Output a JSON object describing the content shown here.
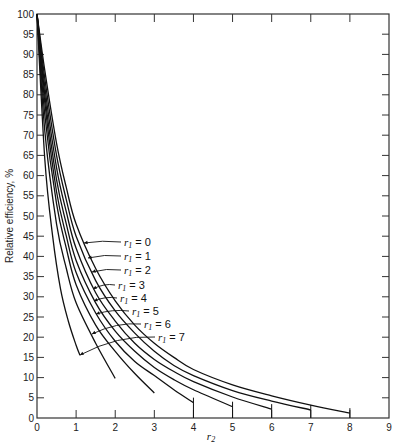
{
  "chart_data": {
    "type": "line",
    "title": "",
    "xlabel": "r2",
    "ylabel": "Relative efficiency, %",
    "xlim": [
      0,
      9
    ],
    "ylim": [
      0,
      100
    ],
    "x_ticks": [
      0,
      1,
      2,
      3,
      4,
      5,
      6,
      7,
      8,
      9
    ],
    "y_ticks": [
      0,
      5,
      10,
      15,
      20,
      25,
      30,
      35,
      40,
      45,
      50,
      55,
      60,
      65,
      70,
      75,
      80,
      85,
      90,
      95,
      100
    ],
    "grid": false,
    "frame": "box with ticks on all sides",
    "series": [
      {
        "name": "r1 = 0",
        "label": "r",
        "sub": "1",
        "eq": " = 0",
        "end_tick": true,
        "points": [
          [
            0,
            100
          ],
          [
            0.2,
            86
          ],
          [
            0.5,
            68
          ],
          [
            0.75,
            57
          ],
          [
            1,
            48
          ],
          [
            1.5,
            37
          ],
          [
            2,
            29
          ],
          [
            2.5,
            23
          ],
          [
            3,
            18.5
          ],
          [
            3.5,
            15
          ],
          [
            4,
            12
          ],
          [
            5,
            8.2
          ],
          [
            6,
            5.5
          ],
          [
            7,
            3.2
          ],
          [
            8,
            1.2
          ]
        ],
        "label_pos": [
          84,
          243
        ],
        "arrow_to": [
          85,
          243
        ]
      },
      {
        "name": "r1 = 1",
        "label": "r",
        "sub": "1",
        "eq": " = 1",
        "end_tick": true,
        "points": [
          [
            0,
            100
          ],
          [
            0.2,
            84
          ],
          [
            0.5,
            65
          ],
          [
            0.75,
            54
          ],
          [
            1,
            45
          ],
          [
            1.5,
            34
          ],
          [
            2,
            26.5
          ],
          [
            2.5,
            21
          ],
          [
            3,
            16.5
          ],
          [
            3.5,
            13
          ],
          [
            4,
            10.5
          ],
          [
            5,
            6.8
          ],
          [
            6,
            4.2
          ],
          [
            7,
            2.0
          ]
        ],
        "label_pos": [
          88,
          258
        ],
        "arrow_to": [
          88,
          258
        ]
      },
      {
        "name": "r1 = 2",
        "label": "r",
        "sub": "1",
        "eq": " = 2",
        "end_tick": true,
        "points": [
          [
            0,
            100
          ],
          [
            0.2,
            82
          ],
          [
            0.5,
            62
          ],
          [
            0.75,
            51
          ],
          [
            1,
            42
          ],
          [
            1.5,
            31
          ],
          [
            2,
            24
          ],
          [
            2.5,
            18.5
          ],
          [
            3,
            14.5
          ],
          [
            3.5,
            11.5
          ],
          [
            4,
            9
          ],
          [
            5,
            5.2
          ],
          [
            6,
            2.2
          ]
        ],
        "label_pos": [
          92,
          272
        ],
        "arrow_to": [
          92,
          272
        ]
      },
      {
        "name": "r1 = 3",
        "label": "r",
        "sub": "1",
        "eq": " = 3",
        "end_tick": true,
        "points": [
          [
            0,
            100
          ],
          [
            0.2,
            80
          ],
          [
            0.5,
            59
          ],
          [
            0.75,
            48
          ],
          [
            1,
            39
          ],
          [
            1.5,
            28.5
          ],
          [
            2,
            21.5
          ],
          [
            2.5,
            16.5
          ],
          [
            3,
            12.5
          ],
          [
            3.5,
            9.5
          ],
          [
            4,
            7
          ],
          [
            5,
            2.8
          ]
        ],
        "label_pos": [
          96,
          287
        ],
        "arrow_to": [
          96,
          287
        ]
      },
      {
        "name": "r1 = 4",
        "label": "r",
        "sub": "1",
        "eq": " = 4",
        "end_tick": true,
        "points": [
          [
            0,
            100
          ],
          [
            0.2,
            78
          ],
          [
            0.5,
            56
          ],
          [
            0.75,
            45
          ],
          [
            1,
            36
          ],
          [
            1.5,
            26
          ],
          [
            2,
            19
          ],
          [
            2.5,
            14
          ],
          [
            3,
            10.5
          ],
          [
            3.5,
            7
          ],
          [
            4,
            3.8
          ]
        ],
        "label_pos": [
          100,
          300
        ],
        "arrow_to": [
          100,
          300
        ]
      },
      {
        "name": "r1 = 5",
        "label": "r",
        "sub": "1",
        "eq": " = 5",
        "end_tick": false,
        "points": [
          [
            0,
            100
          ],
          [
            0.2,
            75
          ],
          [
            0.5,
            53
          ],
          [
            0.75,
            42
          ],
          [
            1,
            33
          ],
          [
            1.5,
            23
          ],
          [
            2,
            16.5
          ],
          [
            2.5,
            11
          ],
          [
            3,
            6.2
          ]
        ],
        "label_pos": [
          103,
          313
        ],
        "arrow_to": [
          103,
          313
        ]
      },
      {
        "name": "r1 = 6",
        "label": "r",
        "sub": "1",
        "eq": " = 6",
        "end_tick": false,
        "points": [
          [
            0,
            100
          ],
          [
            0.2,
            71
          ],
          [
            0.5,
            48
          ],
          [
            0.75,
            37
          ],
          [
            1,
            28.5
          ],
          [
            1.5,
            18.5
          ],
          [
            2,
            9.8
          ]
        ],
        "label_pos": [
          92,
          334
        ],
        "arrow_to": [
          92,
          334
        ]
      },
      {
        "name": "r1 = 7",
        "label": "r",
        "sub": "1",
        "eq": " = 7",
        "end_tick": false,
        "points": [
          [
            0,
            100
          ],
          [
            0.2,
            64
          ],
          [
            0.4,
            45
          ],
          [
            0.6,
            32
          ],
          [
            0.8,
            24
          ],
          [
            1.0,
            18
          ],
          [
            1.1,
            15.5
          ]
        ],
        "label_pos": [
          80,
          355
        ],
        "arrow_to": [
          80,
          355
        ]
      }
    ],
    "labels": [
      {
        "series": "r1 = 0",
        "text_x": 124,
        "text_y": 246,
        "arrow_x": 84,
        "arrow_y": 243
      },
      {
        "series": "r1 = 1",
        "text_x": 124,
        "text_y": 260,
        "arrow_x": 88,
        "arrow_y": 258
      },
      {
        "series": "r1 = 2",
        "text_x": 124,
        "text_y": 274,
        "arrow_x": 92,
        "arrow_y": 272
      },
      {
        "series": "r1 = 3",
        "text_x": 118,
        "text_y": 289,
        "arrow_x": 93,
        "arrow_y": 289
      },
      {
        "series": "r1 = 4",
        "text_x": 120,
        "text_y": 302,
        "arrow_x": 94,
        "arrow_y": 301
      },
      {
        "series": "r1 = 5",
        "text_x": 132,
        "text_y": 315,
        "arrow_x": 96,
        "arrow_y": 314
      },
      {
        "series": "r1 = 6",
        "text_x": 144,
        "text_y": 328,
        "arrow_x": 92,
        "arrow_y": 334
      },
      {
        "series": "r1 = 7",
        "text_x": 158,
        "text_y": 341,
        "arrow_x": 80,
        "arrow_y": 355
      }
    ]
  },
  "plot_area": {
    "left": 37,
    "top": 14,
    "right": 389,
    "bottom": 418
  },
  "colors": {
    "line": "#111111",
    "axis": "#333333",
    "background": "#ffffff"
  }
}
